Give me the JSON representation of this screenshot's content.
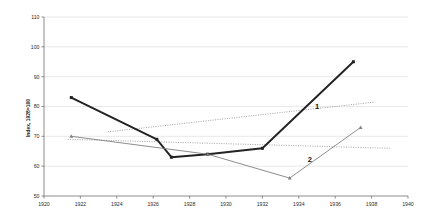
{
  "chart_data": {
    "type": "line",
    "title": "",
    "xlabel": "",
    "ylabel": "Index, 1928=100",
    "xlim": [
      1920,
      1940
    ],
    "ylim": [
      50,
      110
    ],
    "xticks": [
      1920,
      1922,
      1924,
      1926,
      1928,
      1930,
      1932,
      1934,
      1936,
      1938,
      1940
    ],
    "yticks": [
      50,
      60,
      70,
      80,
      90,
      100,
      110
    ],
    "grid": true,
    "legend_position": "inline-annotation",
    "series": [
      {
        "name": "1",
        "label": "1",
        "marker": "square",
        "style": "solid-bold",
        "color": "#222222",
        "x": [
          1921.5,
          1926.2,
          1927.0,
          1929.0,
          1932.0,
          1937.0
        ],
        "y": [
          83,
          69,
          63,
          64,
          66,
          95
        ]
      },
      {
        "name": "2",
        "label": "2",
        "marker": "triangle",
        "style": "solid-thin",
        "color": "#808080",
        "x": [
          1921.5,
          1929.0,
          1933.5,
          1937.4
        ],
        "y": [
          70,
          64,
          56,
          73
        ]
      }
    ],
    "trendlines": [
      {
        "name": "trend-1",
        "style": "dotted",
        "color": "#8a8a8a",
        "x": [
          1923.5,
          1938.2
        ],
        "y": [
          71.5,
          81.5
        ]
      },
      {
        "name": "trend-2",
        "style": "dotted",
        "color": "#8a8a8a",
        "x": [
          1921.3,
          1939.0
        ],
        "y": [
          69.0,
          66.0
        ]
      }
    ],
    "annotations": [
      {
        "text": "1",
        "x": 1935.0,
        "y": 79.0
      },
      {
        "text": "2",
        "x": 1934.6,
        "y": 61.5
      }
    ]
  },
  "axis": {
    "y_title": "Index, 1928=100",
    "y_tick_labels": [
      "110",
      "100",
      "90",
      "80",
      "70",
      "60",
      "50"
    ],
    "x_tick_labels": [
      "1920",
      "1922",
      "1924",
      "1926",
      "1928",
      "1930",
      "1932",
      "1934",
      "1936",
      "1938",
      "1940"
    ]
  },
  "labels": {
    "series_one": "1",
    "series_two": "2"
  },
  "colors": {
    "series_one": "#222222",
    "series_two": "#808080",
    "trendline": "#8a8a8a",
    "gridline": "#d8d8d8",
    "axis": "#707070",
    "background": "#ffffff"
  }
}
